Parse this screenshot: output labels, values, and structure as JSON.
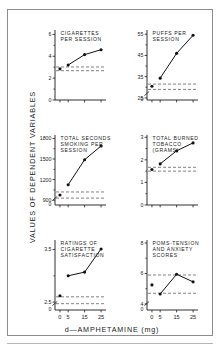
{
  "figure": {
    "ylabel": "VALUES OF DEPENDENT VARIABLES",
    "xlabel": "d—AMPHETAMINE (mg)"
  },
  "chart_data": [
    {
      "type": "line",
      "panel_id": "cigarettes-per-session",
      "title": "CIGARETTES PER SESSION",
      "title_lines": [
        "CIGARETTES",
        "PER  SESSION"
      ],
      "xlabel": "d—AMPHETAMINE (mg)",
      "ylabel": "VALUES OF DEPENDENT VARIABLES",
      "x": [
        0,
        5,
        15,
        25
      ],
      "values": [
        2.85,
        3.2,
        4.15,
        4.6
      ],
      "xtick_labels": [
        "0",
        "5",
        "15",
        "25"
      ],
      "xtick_shown": false,
      "ytick_labels": [
        "0",
        "2",
        "4",
        "6"
      ],
      "ytick_values": [
        0,
        2,
        4,
        6
      ],
      "yminor_values": [
        1,
        3,
        5
      ],
      "ylim": [
        0,
        6.4
      ],
      "xlim": [
        -3,
        28
      ],
      "reference_lines": [
        3.02,
        2.68
      ],
      "baseline_detached": true,
      "axis_break": false,
      "grid": false,
      "legend": "none"
    },
    {
      "type": "line",
      "panel_id": "puffs-per-session",
      "title": "PUFFS PER SESSION",
      "title_lines": [
        "PUFFS  PER",
        "SESSION"
      ],
      "xlabel": "d—AMPHETAMINE (mg)",
      "ylabel": "VALUES OF DEPENDENT VARIABLES",
      "x": [
        0,
        5,
        15,
        25
      ],
      "values": [
        30.5,
        34.3,
        46.0,
        54.5
      ],
      "xtick_labels": [
        "0",
        "5",
        "15",
        "25"
      ],
      "xtick_shown": false,
      "ytick_labels": [
        "25",
        "35",
        "45",
        "55"
      ],
      "ytick_values": [
        25,
        35,
        45,
        55
      ],
      "yminor_values": [
        30,
        40,
        50
      ],
      "ylim": [
        24,
        57
      ],
      "xlim": [
        -3,
        28
      ],
      "reference_lines": [
        31.5,
        29.0
      ],
      "baseline_detached": true,
      "axis_break": true,
      "axis_break_label": "0",
      "grid": false,
      "legend": "none"
    },
    {
      "type": "line",
      "panel_id": "total-seconds-smoking-per-session",
      "title": "TOTAL SECONDS SMOKING PER SESSION",
      "title_lines": [
        "TOTAL  SECONDS",
        "SMOKING  PER",
        "SESSION"
      ],
      "xlabel": "d—AMPHETAMINE (mg)",
      "ylabel": "VALUES OF DEPENDENT VARIABLES",
      "x": [
        0,
        5,
        15,
        25
      ],
      "values": [
        975,
        1125,
        1490,
        1690
      ],
      "xtick_labels": [
        "0",
        "5",
        "15",
        "25"
      ],
      "xtick_shown": false,
      "ytick_labels": [
        "900",
        "1200",
        "1500",
        "1800"
      ],
      "ytick_values": [
        900,
        1200,
        1500,
        1800
      ],
      "yminor_values": [
        1050,
        1350,
        1650
      ],
      "ylim": [
        830,
        1850
      ],
      "xlim": [
        -3,
        28
      ],
      "reference_lines": [
        1020,
        930
      ],
      "baseline_detached": true,
      "axis_break": true,
      "axis_break_label": "0",
      "grid": false,
      "legend": "none"
    },
    {
      "type": "line",
      "panel_id": "total-burned-tobacco",
      "title": "TOTAL BURNED TOBACCO (GRAMS)",
      "title_lines": [
        "TOTAL  BURNED",
        "TOBACCO",
        "(GRAMS)"
      ],
      "xlabel": "d—AMPHETAMINE (mg)",
      "ylabel": "VALUES OF DEPENDENT VARIABLES",
      "x": [
        0,
        5,
        15,
        25
      ],
      "values": [
        1.57,
        1.82,
        2.4,
        2.75
      ],
      "xtick_labels": [
        "0",
        "5",
        "15",
        "25"
      ],
      "xtick_shown": false,
      "ytick_labels": [
        "0",
        "1",
        "2",
        "3"
      ],
      "ytick_values": [
        0,
        1,
        2,
        3
      ],
      "yminor_values": [
        0.5,
        1.5,
        2.5
      ],
      "ylim": [
        0,
        3.1
      ],
      "xlim": [
        -3,
        28
      ],
      "reference_lines": [
        1.67,
        1.5
      ],
      "baseline_detached": true,
      "axis_break": false,
      "grid": false,
      "legend": "none"
    },
    {
      "type": "line",
      "panel_id": "ratings-of-cigarette-satisfaction",
      "title": "RATINGS OF CIGARETTE SATISFACTION",
      "title_lines": [
        "RATINGS  OF",
        "CIGARETTE",
        "SATISFACTION"
      ],
      "xlabel": "d—AMPHETAMINE (mg)",
      "ylabel": "VALUES OF DEPENDENT VARIABLES",
      "x": [
        0,
        5,
        15,
        25
      ],
      "values": [
        2.62,
        3.0,
        3.07,
        3.51
      ],
      "xtick_labels": [
        "0",
        "5",
        "15",
        "25"
      ],
      "xtick_shown": true,
      "ytick_labels": [
        "2.5",
        "3.5"
      ],
      "ytick_values": [
        2.5,
        3.5
      ],
      "yminor_values": [
        3.0
      ],
      "ylim": [
        2.35,
        3.68
      ],
      "xlim": [
        -3,
        28
      ],
      "reference_lines": [
        2.6,
        2.47
      ],
      "baseline_detached": true,
      "axis_break": true,
      "axis_break_label": "0",
      "grid": false,
      "legend": "none"
    },
    {
      "type": "line",
      "panel_id": "poms-tension-and-anxiety-scores",
      "title": "POMS-TENSION AND ANXIETY SCORES",
      "title_lines": [
        "POMS-TENSION",
        "AND  ANXIETY",
        "SCORES"
      ],
      "xlabel": "d—AMPHETAMINE (mg)",
      "ylabel": "VALUES OF DEPENDENT VARIABLES",
      "x": [
        0,
        5,
        15,
        25
      ],
      "values": [
        5.25,
        4.65,
        5.95,
        5.45
      ],
      "xtick_labels": [
        "0",
        "5",
        "15",
        "25"
      ],
      "xtick_shown": true,
      "ytick_labels": [
        "4",
        "6",
        "8"
      ],
      "ytick_values": [
        4,
        6,
        8
      ],
      "yminor_values": [
        5,
        7
      ],
      "ylim": [
        3.6,
        8.2
      ],
      "xlim": [
        -3,
        28
      ],
      "reference_lines": [
        5.9,
        4.7
      ],
      "baseline_detached": true,
      "axis_break": true,
      "axis_break_label": "0",
      "grid": false,
      "legend": "none"
    }
  ]
}
